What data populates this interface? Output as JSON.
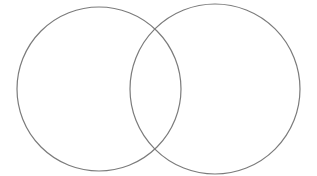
{
  "figure": {
    "kind": "venn-diagram",
    "title": "",
    "background_color": "#ffffff",
    "width": 317,
    "height": 176
  },
  "chart_data": {
    "type": "diagram",
    "subtype": "venn",
    "title": "",
    "xlabel": "",
    "ylabel": "",
    "grid": false,
    "legend": "none",
    "annotations": [],
    "sets": [
      {
        "name": "left-set",
        "label": "",
        "center_x": 99,
        "center_y": 89,
        "radius": 82,
        "stroke_color": "#7b7b7b",
        "stroke_width": 1.2,
        "fill": "none"
      },
      {
        "name": "right-set",
        "label": "",
        "center_x": 215,
        "center_y": 89,
        "radius": 85,
        "stroke_color": "#7b7b7b",
        "stroke_width": 1.2,
        "fill": "none"
      }
    ],
    "intersection": {
      "label": "",
      "top_crossing_x": 165,
      "top_crossing_y": 30,
      "bottom_crossing_x": 165,
      "bottom_crossing_y": 148
    }
  },
  "labels": {
    "left": "",
    "right": "",
    "overlap": ""
  }
}
